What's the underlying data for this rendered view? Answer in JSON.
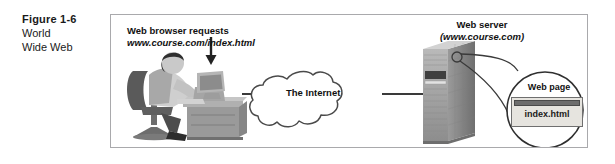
{
  "caption": {
    "figure_number": "Figure 1-6",
    "title_lines": [
      "World",
      "Wide Web"
    ]
  },
  "figure": {
    "client": {
      "label_line1": "Web browser requests",
      "label_url": "www.course.com/index.html",
      "arrow_name": "down-arrow",
      "illustration": "person-at-desk-with-computer"
    },
    "network": {
      "label": "The Internet",
      "shape": "cloud"
    },
    "server": {
      "label_line1": "Web server",
      "label_url": "(www.course.com)",
      "illustration": "server-tower"
    },
    "callout": {
      "label": "Web page",
      "window_filename": "index.html",
      "shape": "magnifier-circle"
    }
  },
  "colors": {
    "frame_border": "#a9a9ac",
    "background": "#ffffff",
    "ink": "#111111",
    "gray_dark": "#585858",
    "gray_mid": "#8e8e8e",
    "gray_light": "#c4c4c4",
    "window_face": "#e6e4df"
  }
}
